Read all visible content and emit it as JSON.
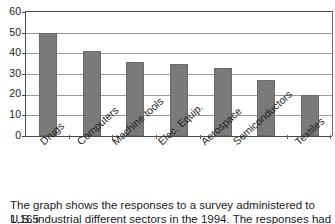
{
  "chart_data": {
    "type": "bar",
    "title": "",
    "subtitle": "",
    "xlabel": "",
    "ylabel": "",
    "categories": [
      "Drugs",
      "Computers",
      "Machine tools",
      "Elec. Equip.",
      "Aerospace",
      "Semiconductors",
      "Textiles"
    ],
    "values": [
      50,
      41,
      36,
      35,
      33,
      27,
      20
    ],
    "series": [
      {
        "name": "Responses",
        "values": [
          50,
          41,
          36,
          35,
          33,
          27,
          20
        ]
      }
    ],
    "ylim": [
      0,
      60
    ],
    "yticks": [
      0,
      10,
      20,
      30,
      40,
      50,
      60
    ],
    "ytick_labels": [
      "0",
      "10",
      "20",
      "30",
      "40",
      "50",
      "60"
    ],
    "grid": true,
    "grid_axis": "y",
    "legend": false,
    "legend_position": "none",
    "bar_color": "#7a7a7a",
    "bar_edge_color": "#6a6a6a",
    "axis_color": "#4a4a4a",
    "gridline_color": "#9a9a9a",
    "background_color": "#ffffff",
    "xtick_label_rotation": -42,
    "annotations": []
  },
  "caption": {
    "line1": "The graph shows the responses to a survey administered to 1,165",
    "line2_partial": "U.S. industrial different sectors in the 1994. The responses had"
  }
}
